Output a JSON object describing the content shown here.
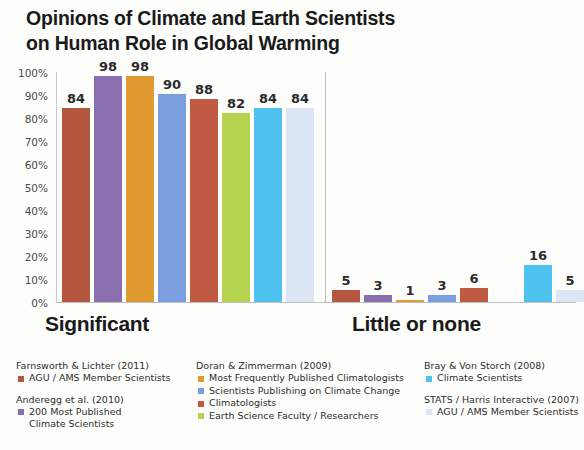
{
  "title": {
    "line1": "Opinions of Climate and Earth Scientists",
    "line2": "on Human Role in Global Warming"
  },
  "chart_data": {
    "type": "bar",
    "title": "Opinions of Climate and Earth Scientists on Human Role in Global Warming",
    "xlabel": "",
    "ylabel": "",
    "ylim": [
      0,
      100
    ],
    "yticks": [
      "0%",
      "10%",
      "20%",
      "30%",
      "40%",
      "50%",
      "60%",
      "70%",
      "80%",
      "90%",
      "100%"
    ],
    "grid": false,
    "legend_position": "bottom",
    "categories": [
      "Significant",
      "Little or none"
    ],
    "series": [
      {
        "name": "AGU / AMS Member Scientists",
        "study": "Farnsworth & Lichter (2011)",
        "color": "#b5563f",
        "values": [
          84,
          5
        ]
      },
      {
        "name": "200 Most Published Climate Scientists",
        "study": "Anderegg et al. (2010)",
        "color": "#8a6fb0",
        "values": [
          98,
          3
        ]
      },
      {
        "name": "Most Frequently Published Climatologists",
        "study": "Doran & Zimmerman (2009)",
        "color": "#e09a32",
        "values": [
          98,
          1
        ]
      },
      {
        "name": "Scientists Publishing on Climate Change",
        "study": "Doran & Zimmerman (2009)",
        "color": "#7b9ede",
        "values": [
          90,
          3
        ]
      },
      {
        "name": "Climatologists",
        "study": "Doran & Zimmerman (2009)",
        "color": "#c15a42",
        "values": [
          88,
          6
        ]
      },
      {
        "name": "Earth Science Faculty / Researchers",
        "study": "Doran & Zimmerman (2009)",
        "color": "#b4d34f",
        "values": [
          82,
          null
        ]
      },
      {
        "name": "Climate Scientists",
        "study": "Bray & Von Storch (2008)",
        "color": "#4ec3f0",
        "values": [
          84,
          16
        ]
      },
      {
        "name": "AGU / AMS Member Scientists",
        "study": "STATS / Harris Interactive (2007)",
        "color": "#dce6f5",
        "values": [
          84,
          5
        ]
      }
    ]
  },
  "yaxis": {
    "ticks": [
      "100%",
      "90%",
      "80%",
      "70%",
      "60%",
      "50%",
      "40%",
      "30%",
      "20%",
      "10%",
      "0%"
    ]
  },
  "categories": [
    {
      "label": "Significant"
    },
    {
      "label": "Little or none"
    }
  ],
  "bars": {
    "significant": [
      {
        "value": "84",
        "color": "#b5563f"
      },
      {
        "value": "98",
        "color": "#8a6fb0"
      },
      {
        "value": "98",
        "color": "#e09a32"
      },
      {
        "value": "90",
        "color": "#7b9ede"
      },
      {
        "value": "88",
        "color": "#c15a42"
      },
      {
        "value": "82",
        "color": "#b4d34f"
      },
      {
        "value": "84",
        "color": "#4ec3f0"
      },
      {
        "value": "84",
        "color": "#dce6f5"
      }
    ],
    "little_or_none": [
      {
        "value": "5",
        "color": "#b5563f"
      },
      {
        "value": "3",
        "color": "#8a6fb0"
      },
      {
        "value": "1",
        "color": "#e09a32"
      },
      {
        "value": "3",
        "color": "#7b9ede"
      },
      {
        "value": "6",
        "color": "#c15a42"
      },
      {
        "value": "",
        "color": "#b4d34f"
      },
      {
        "value": "16",
        "color": "#4ec3f0"
      },
      {
        "value": "5",
        "color": "#dce6f5"
      }
    ]
  },
  "legend": {
    "columns": [
      {
        "studies": [
          {
            "title": "Farnsworth & Lichter (2011)",
            "entries": [
              {
                "color": "#b5563f",
                "line1": "AGU / AMS Member Scientists",
                "line2": ""
              }
            ]
          },
          {
            "title": "Anderegg et al. (2010)",
            "entries": [
              {
                "color": "#8a6fb0",
                "line1": "200 Most Published",
                "line2": "Climate Scientists"
              }
            ]
          }
        ]
      },
      {
        "studies": [
          {
            "title": "Doran & Zimmerman (2009)",
            "entries": [
              {
                "color": "#e09a32",
                "line1": "Most Frequently Published Climatologists",
                "line2": ""
              },
              {
                "color": "#7b9ede",
                "line1": "Scientists Publishing on Climate Change",
                "line2": ""
              },
              {
                "color": "#c15a42",
                "line1": "Climatologists",
                "line2": ""
              },
              {
                "color": "#b4d34f",
                "line1": "Earth Science Faculty / Researchers",
                "line2": ""
              }
            ]
          }
        ]
      },
      {
        "studies": [
          {
            "title": "Bray & Von Storch (2008)",
            "entries": [
              {
                "color": "#4ec3f0",
                "line1": "Climate Scientists",
                "line2": ""
              }
            ]
          },
          {
            "title": "STATS / Harris Interactive (2007)",
            "entries": [
              {
                "color": "#dce6f5",
                "line1": "AGU / AMS Member Scientists",
                "line2": ""
              }
            ]
          }
        ]
      }
    ]
  }
}
